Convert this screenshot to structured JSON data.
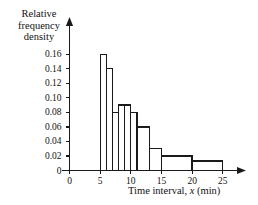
{
  "chart_data": {
    "type": "bar",
    "title": "",
    "subtitle": "",
    "xlabel": "Time interval, x (min)",
    "xlabel_parts": {
      "pre": "Time interval, ",
      "italic": "x",
      "post": " (min)"
    },
    "ylabel": "Relative frequency density",
    "ylabel_lines": [
      "Relative",
      "frequency",
      "density"
    ],
    "xlim": [
      0,
      26.5
    ],
    "ylim": [
      0,
      0.17
    ],
    "xticks": [
      0,
      5,
      10,
      15,
      20,
      25
    ],
    "xtick_labels": [
      "0",
      "5",
      "10",
      "15",
      "20",
      "25"
    ],
    "yticks": [
      0,
      0.02,
      0.04,
      0.06,
      0.08,
      0.1,
      0.12,
      0.14,
      0.16
    ],
    "ytick_labels": [
      "0",
      "0.02",
      "0.04",
      "0.06",
      "0.08",
      "0.10",
      "0.12",
      "0.14",
      "0.16"
    ],
    "grid": false,
    "legend": null,
    "bar_fill": "#ffffff",
    "bar_stroke": "#1a1a1a",
    "axis_color": "#1a1a1a",
    "bins": [
      {
        "x0": 5,
        "x1": 6,
        "density": 0.16
      },
      {
        "x0": 6,
        "x1": 7,
        "density": 0.14
      },
      {
        "x0": 7,
        "x1": 8,
        "density": 0.08
      },
      {
        "x0": 8,
        "x1": 9,
        "density": 0.09
      },
      {
        "x0": 9,
        "x1": 10,
        "density": 0.09
      },
      {
        "x0": 10,
        "x1": 11,
        "density": 0.08
      },
      {
        "x0": 11,
        "x1": 13,
        "density": 0.06
      },
      {
        "x0": 13,
        "x1": 15,
        "density": 0.03
      },
      {
        "x0": 15,
        "x1": 20,
        "density": 0.02
      },
      {
        "x0": 20,
        "x1": 25,
        "density": 0.013
      }
    ]
  }
}
